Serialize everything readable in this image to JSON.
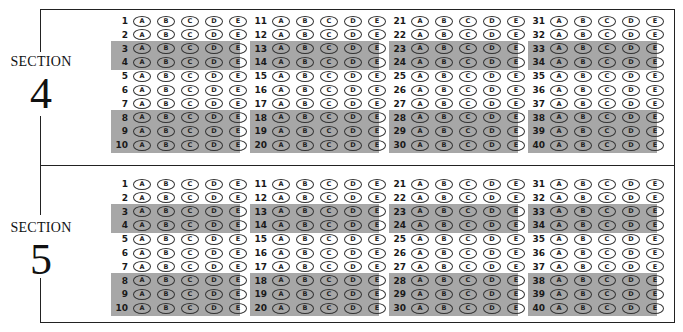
{
  "sheet": {
    "choices": [
      "A",
      "B",
      "C",
      "D",
      "E"
    ],
    "shaded_rows_in_column": [
      3,
      4,
      8,
      9,
      10
    ],
    "colors": {
      "shade": "#a7a7a7",
      "line": "#222222",
      "text": "#1a1a1a"
    },
    "sections": [
      {
        "label": "SECTION",
        "number": "4",
        "columns": [
          {
            "questions": [
              1,
              2,
              3,
              4,
              5,
              6,
              7,
              8,
              9,
              10
            ]
          },
          {
            "questions": [
              11,
              12,
              13,
              14,
              15,
              16,
              17,
              18,
              19,
              20
            ]
          },
          {
            "questions": [
              21,
              22,
              23,
              24,
              25,
              26,
              27,
              28,
              29,
              30
            ]
          },
          {
            "questions": [
              31,
              32,
              33,
              34,
              35,
              36,
              37,
              38,
              39,
              40
            ]
          }
        ]
      },
      {
        "label": "SECTION",
        "number": "5",
        "columns": [
          {
            "questions": [
              1,
              2,
              3,
              4,
              5,
              6,
              7,
              8,
              9,
              10
            ]
          },
          {
            "questions": [
              11,
              12,
              13,
              14,
              15,
              16,
              17,
              18,
              19,
              20
            ]
          },
          {
            "questions": [
              21,
              22,
              23,
              24,
              25,
              26,
              27,
              28,
              29,
              30
            ]
          },
          {
            "questions": [
              31,
              32,
              33,
              34,
              35,
              36,
              37,
              38,
              39,
              40
            ]
          }
        ]
      }
    ]
  }
}
